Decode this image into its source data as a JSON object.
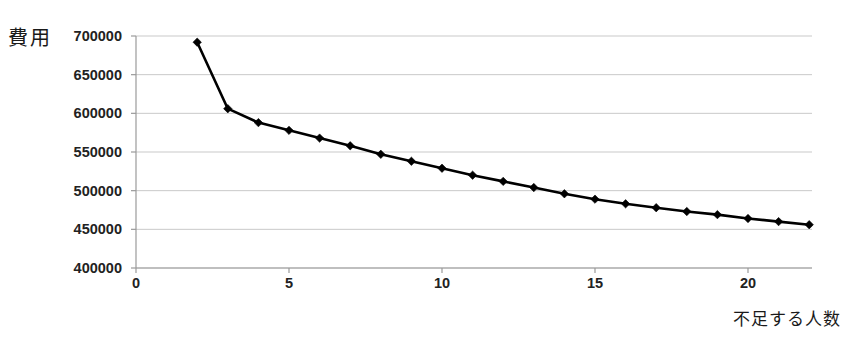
{
  "chart_data": {
    "type": "line",
    "title": "",
    "xlabel": "不足する人数",
    "ylabel": "費用",
    "xlim": [
      0,
      22.5
    ],
    "ylim": [
      400000,
      700000
    ],
    "grid": true,
    "legend": false,
    "marker": "diamond",
    "x_ticks": [
      "0",
      "5",
      "10",
      "15",
      "20"
    ],
    "x_tick_values": [
      0,
      5,
      10,
      15,
      20
    ],
    "y_ticks": [
      "400000",
      "450000",
      "500000",
      "550000",
      "600000",
      "650000",
      "700000"
    ],
    "y_tick_values": [
      400000,
      450000,
      500000,
      550000,
      600000,
      650000,
      700000
    ],
    "x": [
      2,
      3,
      4,
      5,
      6,
      7,
      8,
      9,
      10,
      11,
      12,
      13,
      14,
      15,
      16,
      17,
      18,
      19,
      20,
      21,
      22
    ],
    "values": [
      692000,
      606000,
      588000,
      578000,
      568000,
      558000,
      547000,
      538000,
      529000,
      520000,
      512000,
      504000,
      496000,
      489000,
      483000,
      478000,
      473000,
      469000,
      464000,
      460000,
      456000
    ],
    "series": [
      {
        "name": "費用",
        "color": "#000000",
        "values": [
          692000,
          606000,
          588000,
          578000,
          568000,
          558000,
          547000,
          538000,
          529000,
          520000,
          512000,
          504000,
          496000,
          489000,
          483000,
          478000,
          473000,
          469000,
          464000,
          460000,
          456000
        ]
      }
    ]
  },
  "colors": {
    "line": "#000000",
    "marker": "#000000",
    "grid": "#c9c9c9",
    "axis": "#9a9a9a",
    "text": "#222222",
    "background": "#ffffff"
  }
}
